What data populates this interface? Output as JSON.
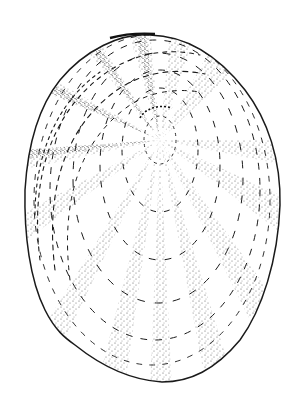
{
  "figure": {
    "subject": "limpet shell, dorsal view",
    "style": "stippled pen-and-ink line drawing",
    "colors": {
      "background": "#ffffff",
      "ink": "#1a1a1a",
      "stipple": "#3a3a3a"
    },
    "outline": {
      "top": [
        150,
        35
      ],
      "left": [
        25,
        190
      ],
      "right": [
        280,
        200
      ],
      "bottom": [
        162,
        382
      ]
    },
    "apex": {
      "cx": 160,
      "cy": 140,
      "rx": 16,
      "ry": 24
    },
    "growth_rings": [
      {
        "cx": 160,
        "cy": 150,
        "rx": 38,
        "ry": 62
      },
      {
        "cx": 160,
        "cy": 165,
        "rx": 60,
        "ry": 95
      },
      {
        "cx": 158,
        "cy": 178,
        "rx": 85,
        "ry": 125
      },
      {
        "cx": 155,
        "cy": 190,
        "rx": 105,
        "ry": 150
      },
      {
        "cx": 152,
        "cy": 200,
        "rx": 118,
        "ry": 165
      }
    ],
    "radial_ray_count": 10
  }
}
